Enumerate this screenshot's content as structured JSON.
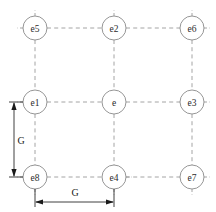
{
  "diagram": {
    "type": "node-grid",
    "canvas": {
      "width": 216,
      "height": 212
    },
    "style": {
      "node_fill": "#ffffff",
      "node_stroke": "#8a8a8a",
      "link_color": "#9a9a9a",
      "dimension_color": "#2b2b2b",
      "label_color": "#2b2b2b",
      "background": "#ffffff",
      "link_style": "dashed",
      "node_radius": 12
    },
    "columns_x": [
      35,
      114,
      192
    ],
    "rows_y": [
      28,
      102,
      177
    ],
    "nodes": [
      {
        "id": "e5",
        "label": "e5",
        "cx": 35,
        "cy": 28,
        "row": 0,
        "col": 0
      },
      {
        "id": "e2",
        "label": "e2",
        "cx": 114,
        "cy": 28,
        "row": 0,
        "col": 1
      },
      {
        "id": "e6",
        "label": "e6",
        "cx": 192,
        "cy": 28,
        "row": 0,
        "col": 2
      },
      {
        "id": "e1",
        "label": "e1",
        "cx": 35,
        "cy": 102,
        "row": 1,
        "col": 0
      },
      {
        "id": "e",
        "label": "e",
        "cx": 114,
        "cy": 102,
        "row": 1,
        "col": 1
      },
      {
        "id": "e3",
        "label": "e3",
        "cx": 192,
        "cy": 102,
        "row": 1,
        "col": 2
      },
      {
        "id": "e8",
        "label": "e8",
        "cx": 35,
        "cy": 177,
        "row": 2,
        "col": 0
      },
      {
        "id": "e4",
        "label": "e4",
        "cx": 114,
        "cy": 177,
        "row": 2,
        "col": 1
      },
      {
        "id": "e7",
        "label": "e7",
        "cx": 192,
        "cy": 177,
        "row": 2,
        "col": 2
      }
    ],
    "links": [
      {
        "from": "e5",
        "to": "e2"
      },
      {
        "from": "e2",
        "to": "e6"
      },
      {
        "from": "e1",
        "to": "e"
      },
      {
        "from": "e",
        "to": "e3"
      },
      {
        "from": "e8",
        "to": "e4"
      },
      {
        "from": "e4",
        "to": "e7"
      },
      {
        "from": "e5",
        "to": "e1"
      },
      {
        "from": "e1",
        "to": "e8"
      },
      {
        "from": "e2",
        "to": "e"
      },
      {
        "from": "e",
        "to": "e4"
      },
      {
        "from": "e6",
        "to": "e3"
      },
      {
        "from": "e3",
        "to": "e7"
      }
    ],
    "dimensions": [
      {
        "id": "vertical-spacing",
        "label": "G",
        "orientation": "vertical",
        "label_x": 21,
        "label_y": 140,
        "line_x": 14,
        "from_y": 102,
        "to_y": 177,
        "measures": "e1 to e8"
      },
      {
        "id": "horizontal-spacing",
        "label": "G",
        "orientation": "horizontal",
        "label_x": 75,
        "label_y": 191,
        "line_y": 202,
        "from_x": 35,
        "to_x": 114,
        "measures": "e8 to e4"
      }
    ]
  }
}
